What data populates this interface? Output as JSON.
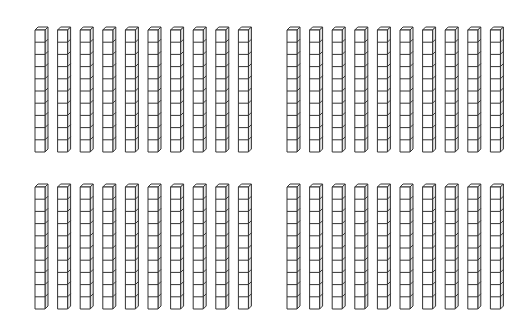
{
  "figure": {
    "background": "#ffffff",
    "stroke_color": "#333333",
    "face_color": "#ffffff",
    "side_color": "#e6e6e6",
    "cubes_per_rod": 10,
    "rods_per_group": 10,
    "total_rods": 40,
    "total_cubes": 400,
    "groups": [
      {
        "name": "top-left",
        "x": 35,
        "y": 27,
        "pitch": 22.6
      },
      {
        "name": "top-right",
        "x": 287,
        "y": 27,
        "pitch": 22.6
      },
      {
        "name": "bottom-left",
        "x": 35,
        "y": 184,
        "pitch": 22.6
      },
      {
        "name": "bottom-right",
        "x": 287,
        "y": 184,
        "pitch": 22.6
      }
    ],
    "rod": {
      "face_width": 10,
      "cube_height": 12.2,
      "depth": 3
    }
  }
}
